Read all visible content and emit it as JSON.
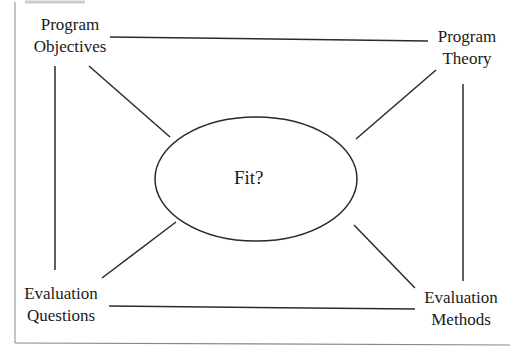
{
  "diagram": {
    "center": {
      "label": "Fit?"
    },
    "nodes": [
      {
        "id": "program-objectives",
        "line1": "Program",
        "line2": "Objectives"
      },
      {
        "id": "program-theory",
        "line1": "Program",
        "line2": "Theory"
      },
      {
        "id": "evaluation-questions",
        "line1": "Evaluation",
        "line2": "Questions"
      },
      {
        "id": "evaluation-methods",
        "line1": "Evaluation",
        "line2": "Methods"
      }
    ],
    "colors": {
      "line": "#2a2a2a",
      "frame": "#777777",
      "background": "#ffffff"
    }
  }
}
